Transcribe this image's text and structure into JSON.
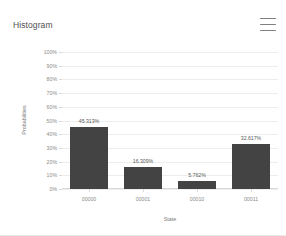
{
  "header": {
    "title": "Histogram",
    "menu_icon": "hamburger-menu-icon"
  },
  "chart_data": {
    "type": "bar",
    "title": "Histogram",
    "categories": [
      "00000",
      "00001",
      "00010",
      "00011"
    ],
    "values": [
      45.313,
      16.309,
      5.762,
      32.617
    ],
    "value_labels": [
      "45.313%",
      "16.309%",
      "5.762%",
      "32.617%"
    ],
    "xlabel": "State",
    "ylabel": "Probabilities",
    "ylim": [
      0,
      100
    ],
    "ytick_labels": [
      "0%",
      "10%",
      "20%",
      "30%",
      "40%",
      "50%",
      "60%",
      "70%",
      "80%",
      "90%",
      "100%"
    ],
    "ytick_values": [
      0,
      10,
      20,
      30,
      40,
      50,
      60,
      70,
      80,
      90,
      100
    ],
    "grid": true,
    "legend": false,
    "bar_color": "#434343",
    "grid_color": "#ededed",
    "axis_text_color": "#8a8a8a"
  }
}
